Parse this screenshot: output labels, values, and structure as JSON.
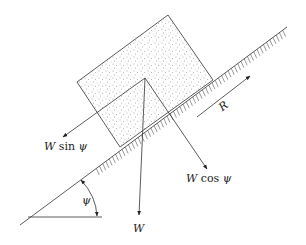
{
  "diagram": {
    "type": "free-body diagram",
    "labels": {
      "w_sin": "W sin ψ",
      "w_cos": "W cos ψ",
      "w": "W",
      "r": "R",
      "angle": "ψ"
    },
    "w_sin_parts": {
      "var": "W",
      "fn": "sin",
      "sym": "ψ"
    },
    "w_cos_parts": {
      "var": "W",
      "fn": "cos",
      "sym": "ψ"
    },
    "colors": {
      "line": "#333333",
      "stipple": "#555555",
      "background": "#ffffff"
    }
  }
}
